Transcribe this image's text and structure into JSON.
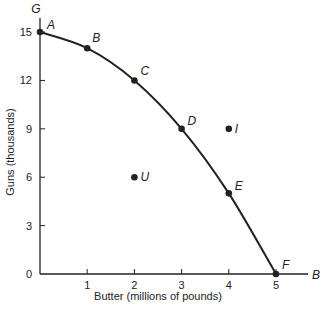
{
  "chart_data": {
    "type": "line",
    "title": "",
    "xlabel": "Butter (millions of pounds)",
    "ylabel": "Guns (thousands)",
    "x_axis_end_label": "B",
    "y_axis_end_label": "G",
    "xlim": [
      0,
      5.7
    ],
    "ylim": [
      0,
      16
    ],
    "x_ticks": [
      0,
      1,
      2,
      3,
      4,
      5
    ],
    "x_tick_labels": [
      "",
      "1",
      "2",
      "3",
      "4",
      "5"
    ],
    "y_ticks": [
      0,
      3,
      6,
      9,
      12,
      15
    ],
    "y_tick_labels": [
      "0",
      "3",
      "6",
      "9",
      "12",
      "15"
    ],
    "grid": false,
    "legend": null,
    "series": [
      {
        "name": "Production possibilities frontier",
        "x": [
          0,
          1,
          2,
          3,
          4,
          5
        ],
        "y": [
          15,
          14,
          12,
          9,
          5,
          0
        ],
        "point_labels": [
          "A",
          "B",
          "C",
          "D",
          "E",
          "F"
        ]
      }
    ],
    "extra_points": [
      {
        "label": "I",
        "x": 4,
        "y": 9
      },
      {
        "label": "U",
        "x": 2,
        "y": 6
      }
    ]
  },
  "colors": {
    "ink": "#222222",
    "background": "#ffffff"
  }
}
